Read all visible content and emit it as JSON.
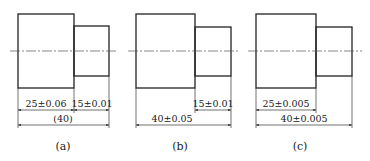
{
  "figures": [
    {
      "id": "a",
      "caption": "(a)",
      "dimensions": {
        "big_length": "25±0.06",
        "small_length": "15±0.01",
        "total_length": "(40)"
      }
    },
    {
      "id": "b",
      "caption": "(b)",
      "dimensions": {
        "small_length": "15±0.01",
        "total_length": "40±0.05"
      }
    },
    {
      "id": "c",
      "caption": "(c)",
      "dimensions": {
        "big_length": "25±0.005",
        "total_length": "40±0.005"
      }
    }
  ]
}
